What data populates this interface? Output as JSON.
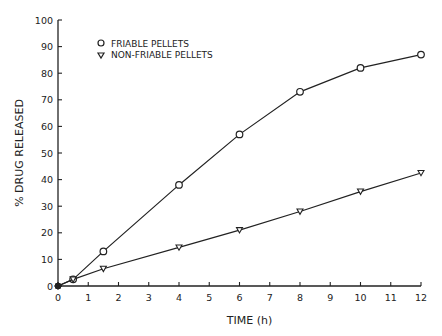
{
  "chart_data": {
    "type": "line",
    "title": "",
    "xlabel": "TIME (h)",
    "ylabel": "% DRUG RELEASED",
    "xlim": [
      0,
      12
    ],
    "ylim": [
      0,
      100
    ],
    "xticks": [
      0,
      1,
      2,
      3,
      4,
      5,
      6,
      7,
      8,
      9,
      10,
      11,
      12
    ],
    "yticks": [
      0,
      10,
      20,
      30,
      40,
      50,
      60,
      70,
      80,
      90,
      100
    ],
    "grid": false,
    "legend_position": "upper-left",
    "series": [
      {
        "name": "FRIABLE PELLETS",
        "marker": "circle",
        "x": [
          0,
          0.5,
          1.5,
          4,
          6,
          8,
          10,
          12
        ],
        "values": [
          0,
          2.5,
          13,
          38,
          57,
          73,
          82,
          87
        ]
      },
      {
        "name": "NON-FRIABLE PELLETS",
        "marker": "triangle-down",
        "x": [
          0,
          0.5,
          1.5,
          4,
          6,
          8,
          10,
          12
        ],
        "values": [
          0,
          2.5,
          6.5,
          14.5,
          21,
          28,
          35.5,
          42.5
        ]
      }
    ],
    "colors": {
      "line": "#222222",
      "marker_fill": "#ffffff",
      "background": "#ffffff"
    }
  }
}
